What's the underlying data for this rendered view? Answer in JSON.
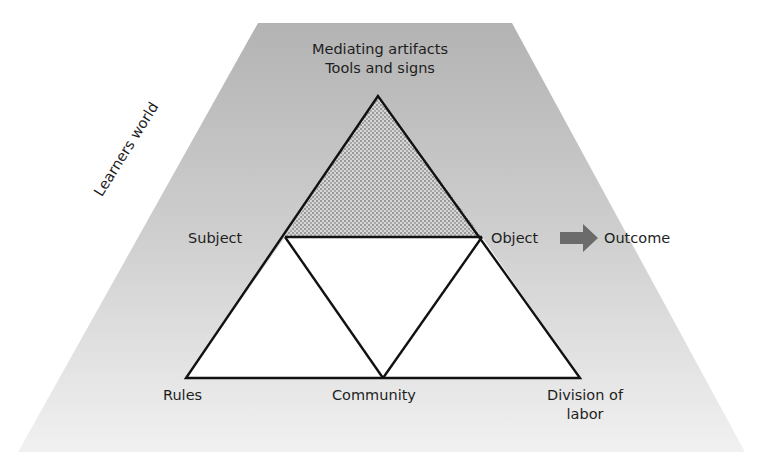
{
  "diagram": {
    "type": "activity-theory-triangle",
    "context_label": "Learners world",
    "top_label": {
      "line1": "Mediating artifacts",
      "line2": "Tools and signs"
    },
    "nodes": {
      "subject": "Subject",
      "object": "Object",
      "outcome": "Outcome",
      "rules": "Rules",
      "community": "Community",
      "division_of_labor_line1": "Division of",
      "division_of_labor_line2": "labor"
    },
    "edges": [
      {
        "from": "Subject",
        "to": "Object"
      },
      {
        "from": "Mediating artifacts",
        "to": "Subject"
      },
      {
        "from": "Mediating artifacts",
        "to": "Object"
      },
      {
        "from": "Subject",
        "to": "Rules"
      },
      {
        "from": "Subject",
        "to": "Community"
      },
      {
        "from": "Object",
        "to": "Community"
      },
      {
        "from": "Object",
        "to": "Division of labor"
      },
      {
        "from": "Rules",
        "to": "Community"
      },
      {
        "from": "Community",
        "to": "Division of labor"
      },
      {
        "from": "Object",
        "to": "Outcome",
        "style": "block-arrow"
      }
    ],
    "colors": {
      "context_top": "#b3b3b3",
      "context_bottom": "#f1f1f1",
      "line": "#111111",
      "hatch_fill": "#c8c8c8",
      "arrow": "#6b6b6b"
    }
  }
}
